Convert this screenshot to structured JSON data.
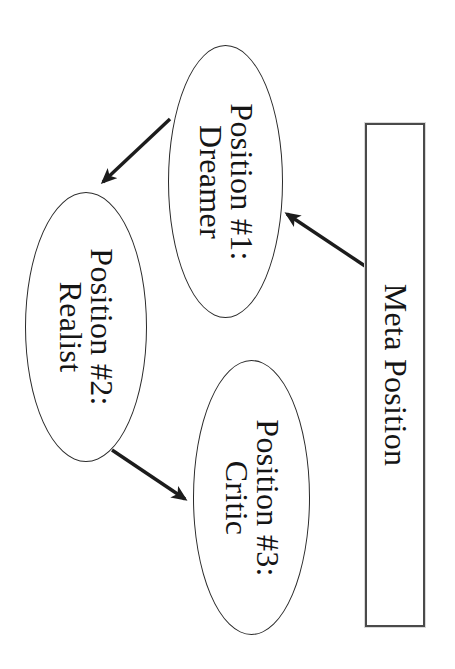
{
  "diagram": {
    "title_hint": "Perceptual positions diagram",
    "position1": {
      "line1": "Position #1:",
      "line2": "Dreamer"
    },
    "position2": {
      "line1": "Position #2:",
      "line2": "Realist"
    },
    "position3": {
      "line1": "Position #3:",
      "line2": "Critic"
    },
    "meta": {
      "label": "Meta Position"
    },
    "connections": [
      {
        "from": "position1",
        "to": "position2"
      },
      {
        "from": "position2",
        "to": "position3"
      },
      {
        "from": "meta",
        "to": "position1"
      }
    ],
    "colors": {
      "background": "#ffffff",
      "shape_stroke": "#2a2a2a",
      "rect_stroke": "#4a4a4a",
      "text": "#151515",
      "arrow": "#1c1c1c"
    }
  }
}
